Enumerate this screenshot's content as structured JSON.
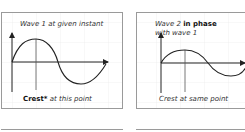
{
  "panels": [
    {
      "id": "wave1",
      "title": "Wave 1 at given instant",
      "caption_bold": "Crest*",
      "caption_rest": " at this point"
    },
    {
      "id": "wave2",
      "title_prefix": "Wave 2 ",
      "title_bold": "in phase",
      "title_line2": "with wave 1",
      "caption": "Crest at same point"
    }
  ],
  "colors": {
    "border": "#9a9a9a",
    "grid": "#e3e3e3",
    "line": "#222222"
  }
}
